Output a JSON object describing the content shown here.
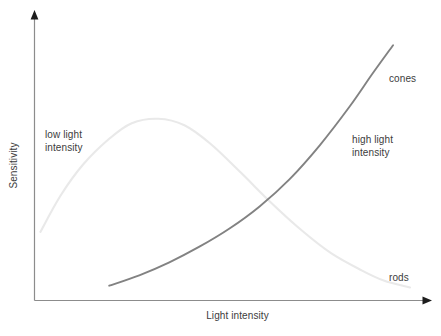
{
  "chart_data": {
    "type": "line",
    "title": "",
    "xlabel": "Light intensity",
    "ylabel": "Sensitivity",
    "grid": false,
    "legend_position": "inline-annotations",
    "axes": {
      "x_arrow": true,
      "y_arrow": true,
      "ticks": false,
      "tick_labels": false,
      "x_range_label": "Light intensity (increasing to the right)",
      "y_range_label": "Sensitivity (increasing upward)"
    },
    "series": [
      {
        "name": "rods",
        "color": "#e9e9e9",
        "description": "Rod sensitivity: rises to a peak at low light intensity then falls off steadily at higher intensities",
        "points": [
          [
            0.017,
            0.262
          ],
          [
            0.07,
            0.4
          ],
          [
            0.13,
            0.52
          ],
          [
            0.2,
            0.62
          ],
          [
            0.26,
            0.68
          ],
          [
            0.33,
            0.697
          ],
          [
            0.4,
            0.672
          ],
          [
            0.47,
            0.6
          ],
          [
            0.55,
            0.49
          ],
          [
            0.63,
            0.375
          ],
          [
            0.71,
            0.27
          ],
          [
            0.79,
            0.18
          ],
          [
            0.87,
            0.115
          ],
          [
            0.93,
            0.075
          ],
          [
            1.0,
            0.048
          ]
        ]
      },
      {
        "name": "cones",
        "color": "#828282",
        "description": "Cone sensitivity: near zero at low light intensity, rising with accelerating slope at high light intensity",
        "points": [
          [
            0.2,
            0.055
          ],
          [
            0.28,
            0.095
          ],
          [
            0.36,
            0.145
          ],
          [
            0.44,
            0.205
          ],
          [
            0.52,
            0.275
          ],
          [
            0.6,
            0.36
          ],
          [
            0.68,
            0.465
          ],
          [
            0.76,
            0.595
          ],
          [
            0.84,
            0.745
          ],
          [
            0.9,
            0.87
          ],
          [
            0.955,
            0.98
          ]
        ]
      }
    ],
    "annotations": [
      {
        "id": "low-light",
        "text": "low light\nintensity",
        "region": "left"
      },
      {
        "id": "high-light",
        "text": "high light\nintensity",
        "region": "right"
      },
      {
        "id": "cones",
        "text": "cones",
        "region": "upper-right"
      },
      {
        "id": "rods",
        "text": "rods",
        "region": "lower-right"
      }
    ]
  },
  "labels": {
    "low_light": "low light\nintensity",
    "high_light": "high light\nintensity",
    "cones": "cones",
    "rods": "rods"
  },
  "axis": {
    "x_title": "Light intensity",
    "y_title": "Sensitivity"
  },
  "colors": {
    "background": "#ffffff",
    "axis": "#8c8c8c",
    "text": "#3c3c3c",
    "rods_curve": "#e9e9e9",
    "cones_curve": "#828282"
  }
}
